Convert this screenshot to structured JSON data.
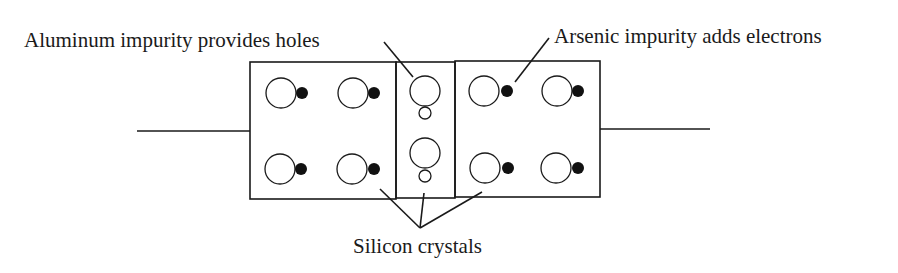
{
  "diagram": {
    "labels": {
      "aluminum": "Aluminum impurity provides holes",
      "arsenic": "Arsenic impurity adds electrons",
      "silicon": "Silicon crystals"
    },
    "regions": [
      {
        "name": "left-crystal",
        "atom_type": "atom-with-electron",
        "count": 4
      },
      {
        "name": "middle-crystal",
        "atom_type": "atom-with-hole",
        "count": 2
      },
      {
        "name": "right-crystal",
        "atom_type": "atom-with-electron",
        "count": 4
      }
    ]
  }
}
